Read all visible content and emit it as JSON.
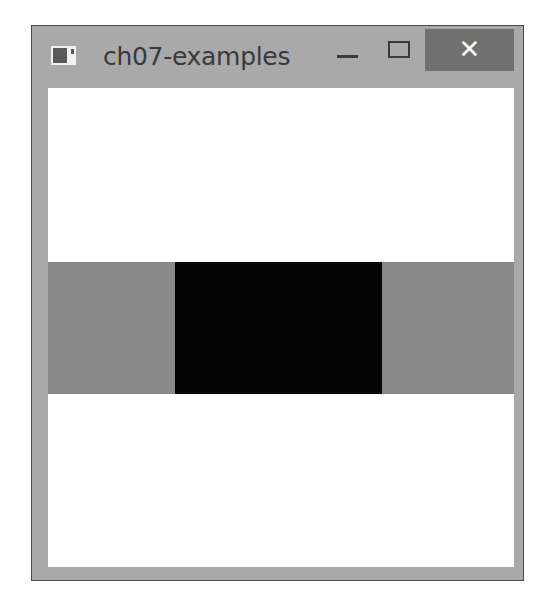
{
  "window": {
    "title": "ch07-examples",
    "icon": "app-window-icon",
    "controls": {
      "minimize": {
        "icon": "minimize-icon",
        "glyph": ""
      },
      "maximize": {
        "icon": "maximize-icon",
        "glyph": ""
      },
      "close": {
        "icon": "close-icon",
        "glyph": "✕"
      }
    }
  },
  "client": {
    "background": "#ffffff",
    "band": {
      "side_color": "#8a8a8a",
      "center_color": "#050505"
    }
  }
}
